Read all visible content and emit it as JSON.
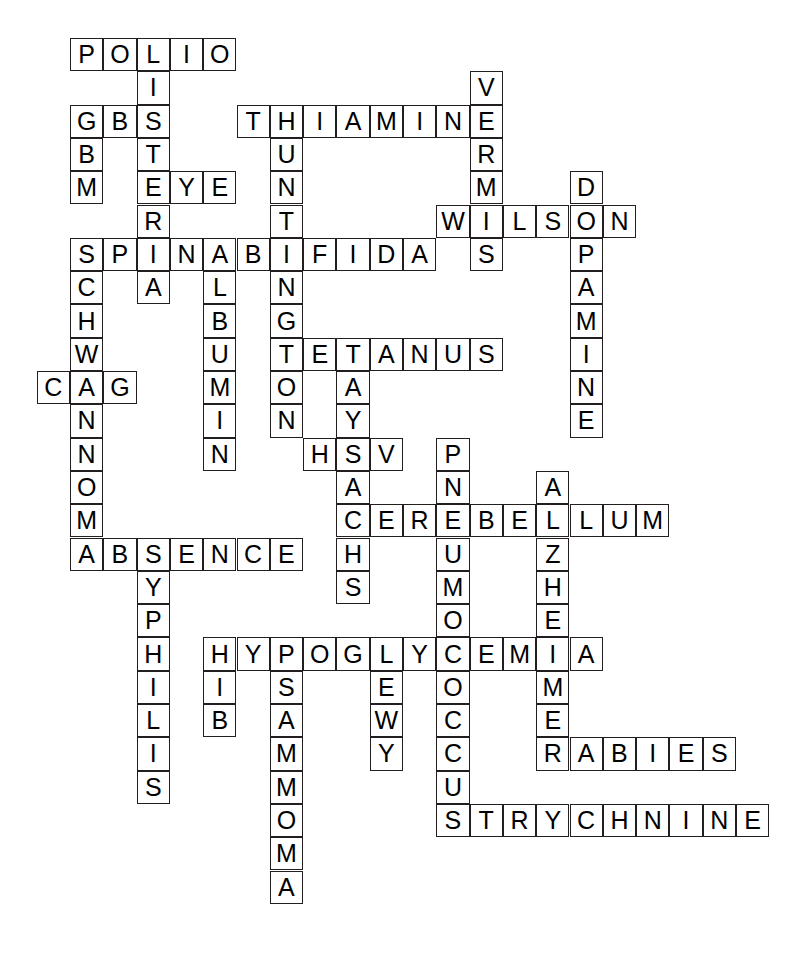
{
  "puzzle": {
    "title": "Neurology crossword grid",
    "grid": {
      "origin_x": 70,
      "origin_y": 38,
      "cell_size": 33.3,
      "cols": 22,
      "rows": 28,
      "cell_fill": "#ffffff",
      "cell_border": "#231f20",
      "letter_color": "#000000",
      "background": "#ffffff"
    },
    "entries": [
      {
        "answer": "POLIO",
        "direction": "across",
        "row": 0,
        "col": 0
      },
      {
        "answer": "LISTERIA",
        "direction": "down",
        "row": 0,
        "col": 2
      },
      {
        "answer": "GBM",
        "direction": "across",
        "row": 2,
        "col": 0
      },
      {
        "answer": "GBM",
        "direction": "down",
        "row": 2,
        "col": 0
      },
      {
        "answer": "THIAMINE",
        "direction": "across",
        "row": 2,
        "col": 5
      },
      {
        "answer": "HUNTINGTON",
        "direction": "down",
        "row": 2,
        "col": 6
      },
      {
        "answer": "VERMIS",
        "direction": "down",
        "row": 1,
        "col": 12
      },
      {
        "answer": "EYE",
        "direction": "across",
        "row": 4,
        "col": 2
      },
      {
        "answer": "DOPAMINE",
        "direction": "down",
        "row": 4,
        "col": 15
      },
      {
        "answer": "WILSON",
        "direction": "across",
        "row": 5,
        "col": 11
      },
      {
        "answer": "SPINABIFIDA",
        "direction": "across",
        "row": 6,
        "col": 0
      },
      {
        "answer": "SCHWANNOMA",
        "direction": "down",
        "row": 6,
        "col": 0
      },
      {
        "answer": "ALBUMIN",
        "direction": "down",
        "row": 6,
        "col": 4
      },
      {
        "answer": "CAG",
        "direction": "across",
        "row": 10,
        "col": -1
      },
      {
        "answer": "TETANUS",
        "direction": "across",
        "row": 9,
        "col": 6
      },
      {
        "answer": "TAYSACHS",
        "direction": "down",
        "row": 9,
        "col": 8
      },
      {
        "answer": "HSV",
        "direction": "across",
        "row": 12,
        "col": 7
      },
      {
        "answer": "PNEUMOCOCCUS",
        "direction": "down",
        "row": 12,
        "col": 11
      },
      {
        "answer": "CEREBELLUM",
        "direction": "across",
        "row": 14,
        "col": 8
      },
      {
        "answer": "ALZHEIMER",
        "direction": "down",
        "row": 13,
        "col": 14
      },
      {
        "answer": "ABSENCE",
        "direction": "across",
        "row": 15,
        "col": 0
      },
      {
        "answer": "SYPHILIS",
        "direction": "down",
        "row": 15,
        "col": 2
      },
      {
        "answer": "HYPOGLYCEMIA",
        "direction": "across",
        "row": 18,
        "col": 4
      },
      {
        "answer": "HIB",
        "direction": "down",
        "row": 18,
        "col": 4
      },
      {
        "answer": "PSAMMOMA",
        "direction": "down",
        "row": 18,
        "col": 6
      },
      {
        "answer": "LEWY",
        "direction": "down",
        "row": 18,
        "col": 9
      },
      {
        "answer": "RABIES",
        "direction": "across",
        "row": 21,
        "col": 14
      },
      {
        "answer": "STRYCHNINE",
        "direction": "across",
        "row": 23,
        "col": 11
      }
    ],
    "cells": [
      {
        "row": 0,
        "col": 0,
        "letter": "P"
      },
      {
        "row": 0,
        "col": 1,
        "letter": "O"
      },
      {
        "row": 0,
        "col": 2,
        "letter": "L"
      },
      {
        "row": 0,
        "col": 3,
        "letter": "I"
      },
      {
        "row": 0,
        "col": 4,
        "letter": "O"
      },
      {
        "row": 1,
        "col": 2,
        "letter": "I"
      },
      {
        "row": 1,
        "col": 12,
        "letter": "V"
      },
      {
        "row": 2,
        "col": 0,
        "letter": "G"
      },
      {
        "row": 2,
        "col": 1,
        "letter": "B"
      },
      {
        "row": 2,
        "col": 2,
        "letter": "S"
      },
      {
        "row": 2,
        "col": 5,
        "letter": "T"
      },
      {
        "row": 2,
        "col": 6,
        "letter": "H"
      },
      {
        "row": 2,
        "col": 7,
        "letter": "I"
      },
      {
        "row": 2,
        "col": 8,
        "letter": "A"
      },
      {
        "row": 2,
        "col": 9,
        "letter": "M"
      },
      {
        "row": 2,
        "col": 10,
        "letter": "I"
      },
      {
        "row": 2,
        "col": 11,
        "letter": "N"
      },
      {
        "row": 2,
        "col": 12,
        "letter": "E"
      },
      {
        "row": 3,
        "col": 0,
        "letter": "B"
      },
      {
        "row": 3,
        "col": 2,
        "letter": "T"
      },
      {
        "row": 3,
        "col": 6,
        "letter": "U"
      },
      {
        "row": 3,
        "col": 12,
        "letter": "R"
      },
      {
        "row": 4,
        "col": 0,
        "letter": "M"
      },
      {
        "row": 4,
        "col": 2,
        "letter": "E"
      },
      {
        "row": 4,
        "col": 3,
        "letter": "Y"
      },
      {
        "row": 4,
        "col": 4,
        "letter": "E"
      },
      {
        "row": 4,
        "col": 6,
        "letter": "N"
      },
      {
        "row": 4,
        "col": 12,
        "letter": "M"
      },
      {
        "row": 4,
        "col": 15,
        "letter": "D"
      },
      {
        "row": 5,
        "col": 2,
        "letter": "R"
      },
      {
        "row": 5,
        "col": 6,
        "letter": "T"
      },
      {
        "row": 5,
        "col": 11,
        "letter": "W"
      },
      {
        "row": 5,
        "col": 12,
        "letter": "I"
      },
      {
        "row": 5,
        "col": 13,
        "letter": "L"
      },
      {
        "row": 5,
        "col": 14,
        "letter": "S"
      },
      {
        "row": 5,
        "col": 15,
        "letter": "O"
      },
      {
        "row": 5,
        "col": 16,
        "letter": "N"
      },
      {
        "row": 6,
        "col": 0,
        "letter": "S"
      },
      {
        "row": 6,
        "col": 1,
        "letter": "P"
      },
      {
        "row": 6,
        "col": 2,
        "letter": "I"
      },
      {
        "row": 6,
        "col": 3,
        "letter": "N"
      },
      {
        "row": 6,
        "col": 4,
        "letter": "A"
      },
      {
        "row": 6,
        "col": 5,
        "letter": "B"
      },
      {
        "row": 6,
        "col": 6,
        "letter": "I"
      },
      {
        "row": 6,
        "col": 7,
        "letter": "F"
      },
      {
        "row": 6,
        "col": 8,
        "letter": "I"
      },
      {
        "row": 6,
        "col": 9,
        "letter": "D"
      },
      {
        "row": 6,
        "col": 10,
        "letter": "A"
      },
      {
        "row": 6,
        "col": 12,
        "letter": "S"
      },
      {
        "row": 6,
        "col": 15,
        "letter": "P"
      },
      {
        "row": 7,
        "col": 0,
        "letter": "C"
      },
      {
        "row": 7,
        "col": 2,
        "letter": "A"
      },
      {
        "row": 7,
        "col": 4,
        "letter": "L"
      },
      {
        "row": 7,
        "col": 6,
        "letter": "N"
      },
      {
        "row": 7,
        "col": 15,
        "letter": "A"
      },
      {
        "row": 8,
        "col": 0,
        "letter": "H"
      },
      {
        "row": 8,
        "col": 4,
        "letter": "B"
      },
      {
        "row": 8,
        "col": 6,
        "letter": "G"
      },
      {
        "row": 8,
        "col": 15,
        "letter": "M"
      },
      {
        "row": 9,
        "col": 0,
        "letter": "W"
      },
      {
        "row": 9,
        "col": 4,
        "letter": "U"
      },
      {
        "row": 9,
        "col": 6,
        "letter": "T"
      },
      {
        "row": 9,
        "col": 7,
        "letter": "E"
      },
      {
        "row": 9,
        "col": 8,
        "letter": "T"
      },
      {
        "row": 9,
        "col": 9,
        "letter": "A"
      },
      {
        "row": 9,
        "col": 10,
        "letter": "N"
      },
      {
        "row": 9,
        "col": 11,
        "letter": "U"
      },
      {
        "row": 9,
        "col": 12,
        "letter": "S"
      },
      {
        "row": 9,
        "col": 15,
        "letter": "I"
      },
      {
        "row": 10,
        "col": -1,
        "letter": "C"
      },
      {
        "row": 10,
        "col": 0,
        "letter": "A"
      },
      {
        "row": 10,
        "col": 1,
        "letter": "G"
      },
      {
        "row": 10,
        "col": 4,
        "letter": "M"
      },
      {
        "row": 10,
        "col": 6,
        "letter": "O"
      },
      {
        "row": 10,
        "col": 8,
        "letter": "A"
      },
      {
        "row": 10,
        "col": 15,
        "letter": "N"
      },
      {
        "row": 11,
        "col": 0,
        "letter": "N"
      },
      {
        "row": 11,
        "col": 4,
        "letter": "I"
      },
      {
        "row": 11,
        "col": 6,
        "letter": "N"
      },
      {
        "row": 11,
        "col": 8,
        "letter": "Y"
      },
      {
        "row": 11,
        "col": 15,
        "letter": "E"
      },
      {
        "row": 12,
        "col": 0,
        "letter": "N"
      },
      {
        "row": 12,
        "col": 4,
        "letter": "N"
      },
      {
        "row": 12,
        "col": 7,
        "letter": "H"
      },
      {
        "row": 12,
        "col": 8,
        "letter": "S"
      },
      {
        "row": 12,
        "col": 9,
        "letter": "V"
      },
      {
        "row": 12,
        "col": 11,
        "letter": "P"
      },
      {
        "row": 13,
        "col": 0,
        "letter": "O"
      },
      {
        "row": 13,
        "col": 8,
        "letter": "A"
      },
      {
        "row": 13,
        "col": 11,
        "letter": "N"
      },
      {
        "row": 13,
        "col": 14,
        "letter": "A"
      },
      {
        "row": 14,
        "col": 0,
        "letter": "M"
      },
      {
        "row": 14,
        "col": 8,
        "letter": "C"
      },
      {
        "row": 14,
        "col": 9,
        "letter": "E"
      },
      {
        "row": 14,
        "col": 10,
        "letter": "R"
      },
      {
        "row": 14,
        "col": 11,
        "letter": "E"
      },
      {
        "row": 14,
        "col": 12,
        "letter": "B"
      },
      {
        "row": 14,
        "col": 13,
        "letter": "E"
      },
      {
        "row": 14,
        "col": 14,
        "letter": "L"
      },
      {
        "row": 14,
        "col": 15,
        "letter": "L"
      },
      {
        "row": 14,
        "col": 16,
        "letter": "U"
      },
      {
        "row": 14,
        "col": 17,
        "letter": "M"
      },
      {
        "row": 15,
        "col": 0,
        "letter": "A"
      },
      {
        "row": 15,
        "col": 1,
        "letter": "B"
      },
      {
        "row": 15,
        "col": 2,
        "letter": "S"
      },
      {
        "row": 15,
        "col": 3,
        "letter": "E"
      },
      {
        "row": 15,
        "col": 4,
        "letter": "N"
      },
      {
        "row": 15,
        "col": 5,
        "letter": "C"
      },
      {
        "row": 15,
        "col": 6,
        "letter": "E"
      },
      {
        "row": 15,
        "col": 8,
        "letter": "H"
      },
      {
        "row": 15,
        "col": 11,
        "letter": "U"
      },
      {
        "row": 15,
        "col": 14,
        "letter": "Z"
      },
      {
        "row": 16,
        "col": 2,
        "letter": "Y"
      },
      {
        "row": 16,
        "col": 8,
        "letter": "S"
      },
      {
        "row": 16,
        "col": 11,
        "letter": "M"
      },
      {
        "row": 16,
        "col": 14,
        "letter": "H"
      },
      {
        "row": 17,
        "col": 2,
        "letter": "P"
      },
      {
        "row": 17,
        "col": 11,
        "letter": "O"
      },
      {
        "row": 17,
        "col": 14,
        "letter": "E"
      },
      {
        "row": 18,
        "col": 2,
        "letter": "H"
      },
      {
        "row": 18,
        "col": 4,
        "letter": "H"
      },
      {
        "row": 18,
        "col": 5,
        "letter": "Y"
      },
      {
        "row": 18,
        "col": 6,
        "letter": "P"
      },
      {
        "row": 18,
        "col": 7,
        "letter": "O"
      },
      {
        "row": 18,
        "col": 8,
        "letter": "G"
      },
      {
        "row": 18,
        "col": 9,
        "letter": "L"
      },
      {
        "row": 18,
        "col": 10,
        "letter": "Y"
      },
      {
        "row": 18,
        "col": 11,
        "letter": "C"
      },
      {
        "row": 18,
        "col": 12,
        "letter": "E"
      },
      {
        "row": 18,
        "col": 13,
        "letter": "M"
      },
      {
        "row": 18,
        "col": 14,
        "letter": "I"
      },
      {
        "row": 18,
        "col": 15,
        "letter": "A"
      },
      {
        "row": 19,
        "col": 2,
        "letter": "I"
      },
      {
        "row": 19,
        "col": 4,
        "letter": "I"
      },
      {
        "row": 19,
        "col": 6,
        "letter": "S"
      },
      {
        "row": 19,
        "col": 9,
        "letter": "E"
      },
      {
        "row": 19,
        "col": 11,
        "letter": "O"
      },
      {
        "row": 19,
        "col": 14,
        "letter": "M"
      },
      {
        "row": 20,
        "col": 2,
        "letter": "L"
      },
      {
        "row": 20,
        "col": 4,
        "letter": "B"
      },
      {
        "row": 20,
        "col": 6,
        "letter": "A"
      },
      {
        "row": 20,
        "col": 9,
        "letter": "W"
      },
      {
        "row": 20,
        "col": 11,
        "letter": "C"
      },
      {
        "row": 20,
        "col": 14,
        "letter": "E"
      },
      {
        "row": 21,
        "col": 2,
        "letter": "I"
      },
      {
        "row": 21,
        "col": 6,
        "letter": "M"
      },
      {
        "row": 21,
        "col": 9,
        "letter": "Y"
      },
      {
        "row": 21,
        "col": 11,
        "letter": "C"
      },
      {
        "row": 21,
        "col": 14,
        "letter": "R"
      },
      {
        "row": 21,
        "col": 15,
        "letter": "A"
      },
      {
        "row": 21,
        "col": 16,
        "letter": "B"
      },
      {
        "row": 21,
        "col": 17,
        "letter": "I"
      },
      {
        "row": 21,
        "col": 18,
        "letter": "E"
      },
      {
        "row": 21,
        "col": 19,
        "letter": "S"
      },
      {
        "row": 22,
        "col": 2,
        "letter": "S"
      },
      {
        "row": 22,
        "col": 6,
        "letter": "M"
      },
      {
        "row": 22,
        "col": 11,
        "letter": "U"
      },
      {
        "row": 23,
        "col": 6,
        "letter": "O"
      },
      {
        "row": 23,
        "col": 11,
        "letter": "S"
      },
      {
        "row": 23,
        "col": 12,
        "letter": "T"
      },
      {
        "row": 23,
        "col": 13,
        "letter": "R"
      },
      {
        "row": 23,
        "col": 14,
        "letter": "Y"
      },
      {
        "row": 23,
        "col": 15,
        "letter": "C"
      },
      {
        "row": 23,
        "col": 16,
        "letter": "H"
      },
      {
        "row": 23,
        "col": 17,
        "letter": "N"
      },
      {
        "row": 23,
        "col": 18,
        "letter": "I"
      },
      {
        "row": 23,
        "col": 19,
        "letter": "N"
      },
      {
        "row": 23,
        "col": 20,
        "letter": "E"
      },
      {
        "row": 24,
        "col": 6,
        "letter": "M"
      },
      {
        "row": 25,
        "col": 6,
        "letter": "A"
      }
    ]
  }
}
